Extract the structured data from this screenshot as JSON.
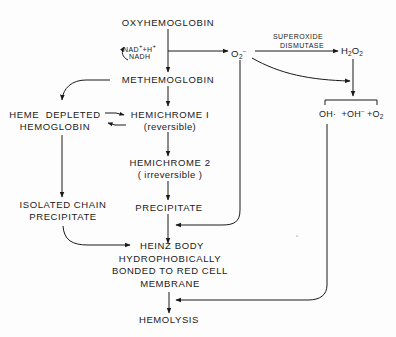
{
  "diagram": {
    "nodes": {
      "oxyhemoglobin": "OXYHEMOGLOBIN",
      "nad": "NAD",
      "nad_plus": "+",
      "nad_h": "+H",
      "nad_h_plus": "+",
      "nadh": "NADH",
      "methemoglobin": "METHEMOGLOBIN",
      "heme_depleted_line1": "HEME  DEPLETED",
      "heme_depleted_line2": "HEMOGLOBIN",
      "hemichrome1_line1": "HEMICHROME I",
      "hemichrome1_line2": "(reversible)",
      "hemichrome2_line1": "HEMICHROME 2",
      "hemichrome2_line2": "( irreversible )",
      "precipitate": "PRECIPITATE",
      "isolated_chain_line1": "ISOLATED CHAIN",
      "isolated_chain_line2": "PRECIPITATE",
      "heinz_line1": "HEINZ BODY",
      "heinz_line2": "HYDROPHOBICALLY",
      "heinz_line3": "BONDED TO RED CELL",
      "heinz_line4": "MEMBRANE",
      "hemolysis": "HEMOLYSIS",
      "superoxide_O": "O",
      "superoxide_sub": "2",
      "superoxide_charge": "−",
      "sod_line1": "SUPEROXIDE",
      "sod_line2": "DISMUTASE",
      "h2o2_H": "H",
      "h2o2_sub1": "2",
      "h2o2_O": "O",
      "h2o2_sub2": "2",
      "products_oh_radical": "OH·",
      "products_oh_ion": "+OH",
      "products_oh_charge": "−",
      "products_o2": "+O",
      "products_o2_sub": "2"
    },
    "edges": [
      {
        "from": "OXYHEMOGLOBIN",
        "to": "METHEMOGLOBIN",
        "label": "NAD+ +H+ / NADH"
      },
      {
        "from": "OXYHEMOGLOBIN",
        "to": "O2-"
      },
      {
        "from": "O2-",
        "to": "H2O2",
        "label": "SUPEROXIDE DISMUTASE"
      },
      {
        "from": "O2-",
        "to": "OH· +OH- +O2"
      },
      {
        "from": "H2O2",
        "to": "OH· +OH- +O2"
      },
      {
        "from": "METHEMOGLOBIN",
        "to": "HEME DEPLETED HEMOGLOBIN"
      },
      {
        "from": "METHEMOGLOBIN",
        "to": "HEMICHROME I"
      },
      {
        "from": "HEME DEPLETED HEMOGLOBIN",
        "to": "HEMICHROME I",
        "bidirectional": true
      },
      {
        "from": "HEMICHROME I",
        "to": "HEMICHROME 2"
      },
      {
        "from": "HEMICHROME 2",
        "to": "PRECIPITATE"
      },
      {
        "from": "O2-",
        "to": "PRECIPITATE/HEINZ junction"
      },
      {
        "from": "HEME DEPLETED HEMOGLOBIN",
        "to": "ISOLATED CHAIN PRECIPITATE"
      },
      {
        "from": "ISOLATED CHAIN PRECIPITATE",
        "to": "HEINZ BODY"
      },
      {
        "from": "PRECIPITATE",
        "to": "HEINZ BODY"
      },
      {
        "from": "HEINZ BODY",
        "to": "HEMOLYSIS"
      },
      {
        "from": "OH· +OH- +O2",
        "to": "HEMOLYSIS"
      }
    ],
    "colors": {
      "ink": "#1a1a1a",
      "background": "#fdfdfd"
    }
  }
}
